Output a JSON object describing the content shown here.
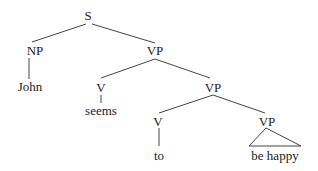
{
  "tree": {
    "nodes": [
      {
        "id": "S",
        "label": "S",
        "x": 88,
        "y": 9
      },
      {
        "id": "NP",
        "label": "NP",
        "x": 35,
        "y": 44
      },
      {
        "id": "VP1",
        "label": "VP",
        "x": 155,
        "y": 44
      },
      {
        "id": "John",
        "label": "John",
        "x": 35,
        "y": 80
      },
      {
        "id": "V1",
        "label": "V",
        "x": 101,
        "y": 81
      },
      {
        "id": "seems",
        "label": "seems",
        "x": 101,
        "y": 104
      },
      {
        "id": "VP2",
        "label": "VP",
        "x": 213,
        "y": 81
      },
      {
        "id": "V2",
        "label": "V",
        "x": 158,
        "y": 115
      },
      {
        "id": "to",
        "label": "to",
        "x": 159,
        "y": 149
      },
      {
        "id": "VP3",
        "label": "VP",
        "x": 267,
        "y": 115
      },
      {
        "id": "behappy",
        "label": "be happy",
        "x": 275,
        "y": 149
      }
    ]
  }
}
